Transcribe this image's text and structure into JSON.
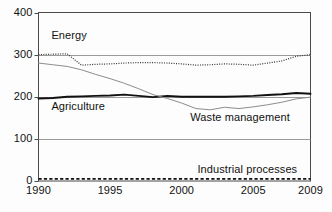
{
  "chart_data": {
    "type": "line",
    "title": "",
    "subtitle": "",
    "xlabel": "",
    "ylabel": "",
    "xlim": [
      1990,
      2009
    ],
    "ylim": [
      0,
      400
    ],
    "yticks": [
      0,
      100,
      200,
      300,
      400
    ],
    "ytick_labels": [
      "0",
      "100",
      "200",
      "300",
      "400"
    ],
    "xticks": [
      1990,
      1995,
      2000,
      2005,
      2009
    ],
    "xtick_labels": [
      "1990",
      "1995",
      "2000",
      "2005",
      "2009"
    ],
    "grid": "horizontal-gridlines-at-100-200-300",
    "legend_position": "inline-annotations",
    "x": [
      1990,
      1991,
      1992,
      1993,
      1994,
      1995,
      1996,
      1997,
      1998,
      1999,
      2000,
      2001,
      2002,
      2003,
      2004,
      2005,
      2006,
      2007,
      2008,
      2009
    ],
    "series": [
      {
        "name": "Energy",
        "style": "dotted",
        "color": "#333333",
        "values": [
          300,
          301,
          302,
          275,
          277,
          278,
          280,
          281,
          281,
          280,
          278,
          275,
          276,
          278,
          277,
          275,
          280,
          285,
          296,
          300
        ]
      },
      {
        "name": "Agriculture",
        "style": "solid-thick",
        "color": "#111111",
        "values": [
          196,
          197,
          200,
          201,
          202,
          203,
          205,
          202,
          199,
          202,
          200,
          200,
          200,
          200,
          201,
          202,
          204,
          206,
          209,
          207
        ]
      },
      {
        "name": "Waste management",
        "style": "solid-thin",
        "color": "#8c8c8c",
        "values": [
          280,
          276,
          272,
          264,
          253,
          243,
          232,
          219,
          205,
          196,
          185,
          172,
          169,
          175,
          172,
          176,
          181,
          187,
          195,
          199
        ]
      },
      {
        "name": "Industrial processes",
        "style": "dashed",
        "color": "#111111",
        "values": [
          5,
          5,
          5,
          5,
          5,
          5,
          5,
          5,
          5,
          5,
          5,
          5,
          5,
          5,
          5,
          5,
          5,
          5,
          5,
          5
        ]
      }
    ],
    "annotations": [
      {
        "text": "Energy",
        "x": 1990.9,
        "y": 345,
        "align": "left"
      },
      {
        "text": "Agriculture",
        "x": 1990.9,
        "y": 175,
        "align": "left"
      },
      {
        "text": "Waste management",
        "x": 2000.6,
        "y": 150,
        "align": "left"
      },
      {
        "text": "Industrial processes",
        "x": 2001.1,
        "y": 27,
        "align": "left"
      }
    ]
  },
  "axes": {
    "y_ticks": [
      {
        "label": "400",
        "value": 400
      },
      {
        "label": "300",
        "value": 300
      },
      {
        "label": "200",
        "value": 200
      },
      {
        "label": "100",
        "value": 100
      },
      {
        "label": "0",
        "value": 0
      }
    ],
    "x_ticks": [
      {
        "label": "1990",
        "value": 1990
      },
      {
        "label": "1995",
        "value": 1995
      },
      {
        "label": "2000",
        "value": 2000
      },
      {
        "label": "2005",
        "value": 2005
      },
      {
        "label": "2009",
        "value": 2009
      }
    ]
  },
  "colors": {
    "axis": "#4a4a4a",
    "gridline": "#9a9a9a",
    "energy": "#333333",
    "agriculture": "#111111",
    "waste": "#8c8c8c",
    "industrial": "#111111",
    "background": "#fdfdfd"
  }
}
